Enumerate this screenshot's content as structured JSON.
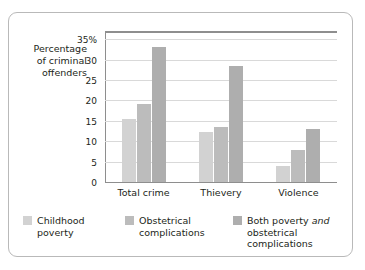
{
  "chart_data": {
    "type": "bar",
    "title": "",
    "xlabel": "",
    "ylabel": "Percentage of criminal offenders",
    "ylim": [
      0,
      37
    ],
    "yticks": [
      "0",
      "5",
      "10",
      "15",
      "20",
      "25",
      "30",
      "35%"
    ],
    "ytick_values": [
      0,
      5,
      10,
      15,
      20,
      25,
      30,
      35
    ],
    "grid": true,
    "legend_position": "bottom",
    "categories": [
      "Total crime",
      "Thievery",
      "Violence"
    ],
    "series": [
      {
        "name": "Childhood poverty",
        "values": [
          15.5,
          12.3,
          4.0
        ],
        "color": "#d2d2d2"
      },
      {
        "name": "Obstetrical complications",
        "values": [
          19.0,
          13.5,
          7.8
        ],
        "color": "#bcbcbc"
      },
      {
        "name": "Both poverty and obstetrical complications",
        "values": [
          33.0,
          28.5,
          13.0
        ],
        "color": "#aeaeae"
      }
    ]
  },
  "axis_title": {
    "line1": "Percentage",
    "line2": "of criminal",
    "line3": "offenders"
  },
  "legend": [
    {
      "line1": "Childhood",
      "line2": "poverty",
      "pre": "",
      "em": "",
      "post": ""
    },
    {
      "line1": "Obstetrical",
      "line2": "complications",
      "pre": "",
      "em": "",
      "post": ""
    },
    {
      "line1": "",
      "line2": "obstetrical complications",
      "pre": "Both poverty ",
      "em": "and",
      "post": ""
    }
  ]
}
